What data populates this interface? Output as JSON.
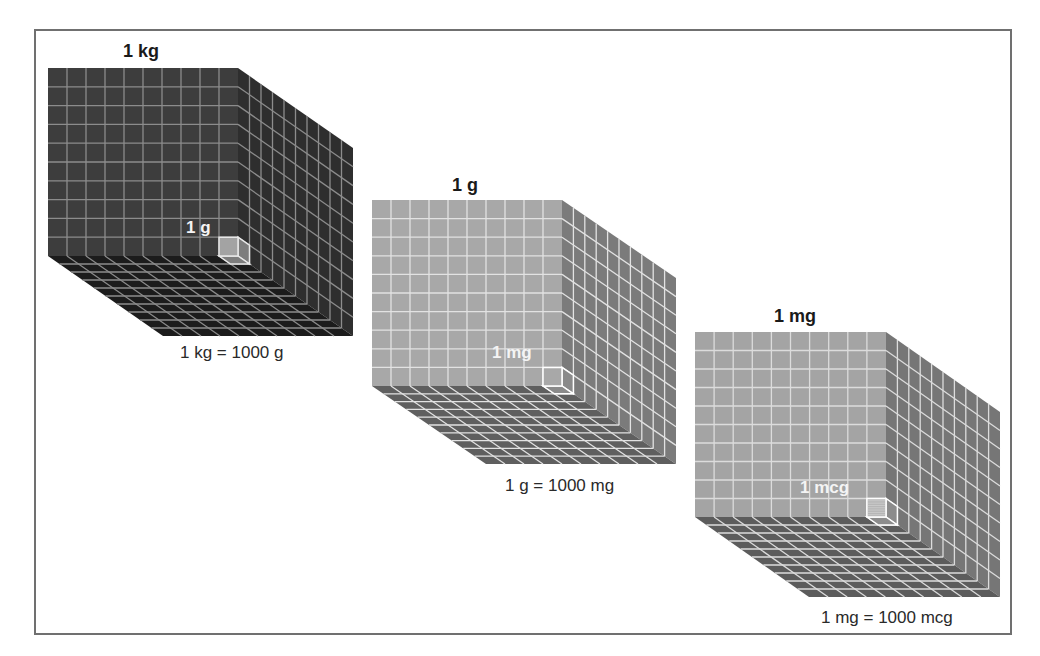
{
  "diagram": {
    "cubes": [
      {
        "id": "kg",
        "title": "1 kg",
        "unit_label": "1 g",
        "equation": "1 kg = 1000 g",
        "grid": 10,
        "colors": {
          "front": "#3d3d3d",
          "side": "#2e2e2e",
          "bottom": "#1c1c1c",
          "grid": "#8c8c8c",
          "unit_front": "#a3a3a3",
          "unit_side": "#7d7d7d",
          "unit_edge": "#e8e8e8"
        }
      },
      {
        "id": "g",
        "title": "1 g",
        "unit_label": "1 mg",
        "equation": "1 g = 1000 mg",
        "grid": 10,
        "colors": {
          "front": "#a8a8a8",
          "side": "#7b7b7b",
          "bottom": "#5f5f5f",
          "grid": "#e2e2e2",
          "unit_front": "#a8a8a8",
          "unit_side": "#8a8a8a",
          "unit_edge": "#ffffff"
        }
      },
      {
        "id": "mg",
        "title": "1 mg",
        "unit_label": "1 mcg",
        "equation": "1 mg = 1000 mcg",
        "grid": 10,
        "colors": {
          "front": "#a4a4a4",
          "side": "#767676",
          "bottom": "#5c5c5c",
          "grid": "#dcdcdc",
          "unit_front": "#b6b6b6",
          "unit_side": "#8c8c8c",
          "unit_edge": "#ffffff"
        }
      }
    ]
  }
}
